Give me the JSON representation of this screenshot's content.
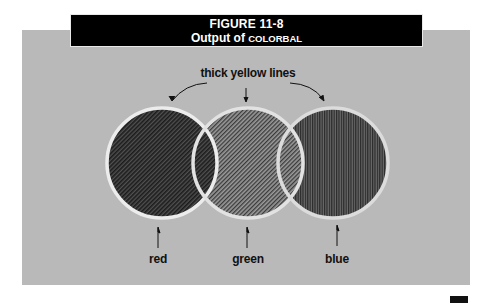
{
  "figure": {
    "number": "FIGURE 11-8",
    "caption_prefix": "Output of ",
    "caption_program": "COLORBAL"
  },
  "annotation": {
    "top_label": "thick yellow lines"
  },
  "circles": [
    {
      "name": "red",
      "label": "red",
      "cx": 162,
      "cy": 163,
      "r": 55,
      "pattern": "diagonal-dense-dark"
    },
    {
      "name": "green",
      "label": "green",
      "cx": 248,
      "cy": 163,
      "r": 55,
      "pattern": "diagonal-light"
    },
    {
      "name": "blue",
      "label": "blue",
      "cx": 333,
      "cy": 163,
      "r": 55,
      "pattern": "vertical-dark"
    }
  ],
  "colors": {
    "panel": "#b9b9b9",
    "titlebar": "#000000",
    "outline": "#ececec"
  }
}
